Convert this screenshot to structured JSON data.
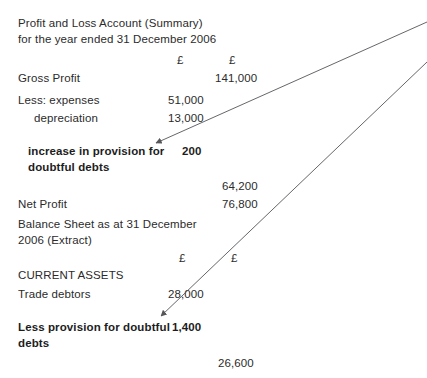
{
  "document": {
    "title_line_1": "Profit and Loss Account (Summary)",
    "title_line_2": "for the year ended 31 December 2006",
    "currency_symbol": "£"
  },
  "profit_and_loss": {
    "column_headers": [
      "£",
      "£"
    ],
    "rows": [
      {
        "label": "Gross Profit",
        "col1": "",
        "col2": "141,000",
        "bold": false
      },
      {
        "label": "Less: expenses",
        "col1": "51,000",
        "col2": "",
        "bold": false
      },
      {
        "label": "depreciation",
        "col1": "13,000",
        "col2": "",
        "bold": false
      },
      {
        "label": "increase in provision for",
        "col1": "200",
        "col2": "",
        "bold": true
      },
      {
        "label": "doubtful debts",
        "col1": "",
        "col2": "",
        "bold": true
      },
      {
        "label": "",
        "col1": "",
        "col2": "64,200",
        "bold": false
      },
      {
        "label": "Net Profit",
        "col1": "",
        "col2": "76,800",
        "bold": false
      }
    ]
  },
  "balance_sheet": {
    "title_line_1": "Balance Sheet as at 31 December",
    "title_line_2": "2006 (Extract)",
    "column_headers": [
      "£",
      "£"
    ],
    "section_heading": "CURRENT ASSETS",
    "rows": [
      {
        "label": "Trade debtors",
        "col1": "28,000",
        "col2": "",
        "bold": false
      },
      {
        "label": "Less provision for doubtful",
        "col1": "1,400",
        "col2": "",
        "bold": true
      },
      {
        "label": "debts",
        "col1": "",
        "col2": "",
        "bold": true
      },
      {
        "label": "",
        "col1": "",
        "col2": "26,600",
        "bold": false
      }
    ]
  },
  "annotations": {
    "arrows": [
      {
        "name": "arrow-to-increase-in-provision",
        "from_label": "off-page right margin",
        "to_label": "increase in provision for doubtful debts"
      },
      {
        "name": "arrow-to-less-provision",
        "from_label": "off-page right margin",
        "to_label": "Less provision for doubtful debts"
      }
    ],
    "line_color": "#55555a"
  }
}
